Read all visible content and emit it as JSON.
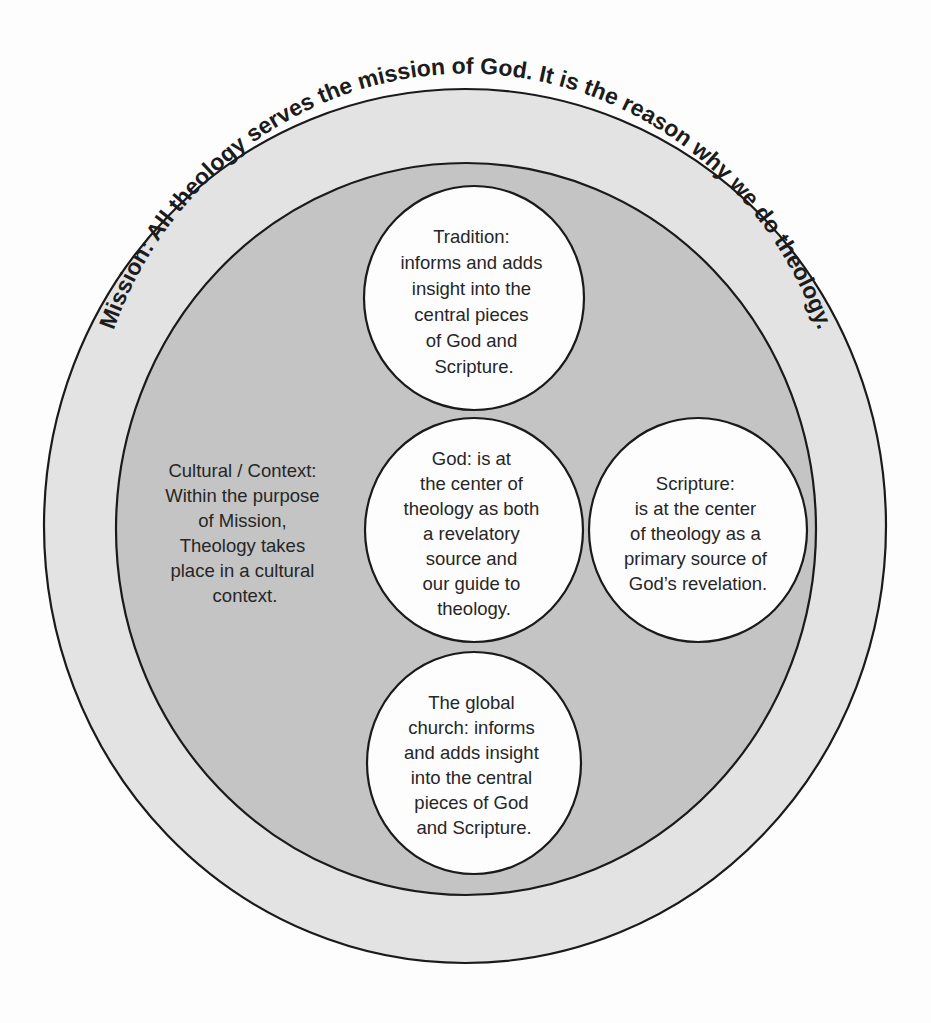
{
  "diagram": {
    "colors": {
      "background": "#fdfdfd",
      "outer_ring": "#e3e3e3",
      "inner_disc": "#c4c4c4",
      "node_fill": "#fdfdfd",
      "stroke": "#1a1a1a",
      "text": "#262626"
    },
    "mission": {
      "label": "Mission: All theology serves the mission of God. It is the reason why we do theology."
    },
    "context": {
      "lines": [
        "Cultural / Context:",
        "Within the purpose",
        "of Mission,",
        "Theology takes",
        "place in a cultural",
        "context."
      ]
    },
    "nodes": {
      "tradition": {
        "lines": [
          "Tradition:",
          "informs and adds",
          "insight into the",
          "central pieces",
          "of God and",
          "Scripture."
        ]
      },
      "god": {
        "lines": [
          "God: is at",
          "the center of",
          "theology as both",
          "a revelatory",
          "source and",
          "our guide to",
          "theology."
        ]
      },
      "scripture": {
        "lines": [
          "Scripture:",
          "is at the center",
          "of theology as a",
          "primary source of",
          "God’s revelation."
        ]
      },
      "global_church": {
        "lines": [
          "The global",
          "church: informs",
          "and adds insight",
          "into the central",
          "pieces of God",
          "and Scripture."
        ]
      }
    }
  }
}
